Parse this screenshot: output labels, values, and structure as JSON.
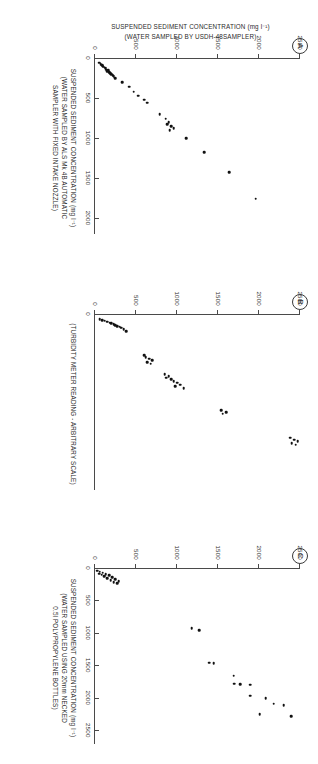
{
  "figure": {
    "orientation": "rotated-90-clockwise",
    "shared_y_axis": {
      "title_line1": "SUSPENDED SEDIMENT CONCENTRATION (mg l⁻¹)",
      "title_line2": "(WATER SAMPLED BY USDH-48SAMPLER)",
      "ticks": [
        0,
        500,
        1000,
        1500,
        2000,
        2500
      ],
      "tick_labels": [
        "0",
        "500",
        "1000",
        "1500",
        "2000",
        "2500"
      ],
      "min": 0,
      "max": 2500
    },
    "panels": [
      {
        "letter": "A",
        "x_title_lines": [
          "SUSPENDED SEDIMENT CONCENTRATION (mg l⁻¹)",
          "(WATER SAMPLED BY ALS Mk 4B AUTOMATIC",
          "SAMPLER WITH FIXED INTAKE NOZZLE)"
        ],
        "x_ticks": [
          0,
          500,
          1000,
          1500,
          2000
        ],
        "x_tick_labels": [
          "0",
          "500",
          "1000",
          "1500",
          "2000"
        ],
        "x_min": 0,
        "x_max": 2150
      },
      {
        "letter": "B",
        "x_title_lines": [
          "(TURBIDITY METER READING - ARBITRARY SCALE)"
        ],
        "x_ticks": [
          0
        ],
        "x_tick_labels": [
          "0"
        ],
        "x_min": 0,
        "x_max": 100
      },
      {
        "letter": "C",
        "x_title_lines": [
          "SUSPENDED SEDIMENT CONCENTRATION (mg l⁻¹)",
          "(WATER SAMPLED USING 20mm NECKED",
          "0.5l POLYPROPYLENE BOTTLES)"
        ],
        "x_ticks": [
          0,
          500,
          1000,
          1500,
          2000,
          2500
        ],
        "x_tick_labels": [
          "0",
          "500",
          "1000",
          "1500",
          "2000",
          "2500"
        ],
        "x_min": 0,
        "x_max": 2650
      }
    ]
  },
  "chart_data": [
    {
      "type": "scatter",
      "title": "A",
      "xlabel": "SUSPENDED SEDIMENT CONCENTRATION (mg l-1) (WATER SAMPLED BY ALS Mk 4B AUTOMATIC SAMPLER WITH FIXED INTAKE NOZZLE)",
      "ylabel": "SUSPENDED SEDIMENT CONCENTRATION (mg l-1) (WATER SAMPLED BY USDH-48SAMPLER)",
      "xlim": [
        0,
        2150
      ],
      "ylim": [
        0,
        2500
      ],
      "grid": false,
      "legend": null,
      "points": [
        [
          60,
          55
        ],
        [
          75,
          70
        ],
        [
          90,
          85
        ],
        [
          100,
          95
        ],
        [
          110,
          105
        ],
        [
          120,
          120
        ],
        [
          130,
          130
        ],
        [
          145,
          140
        ],
        [
          155,
          160
        ],
        [
          165,
          150
        ],
        [
          175,
          175
        ],
        [
          190,
          185
        ],
        [
          205,
          200
        ],
        [
          215,
          215
        ],
        [
          230,
          230
        ],
        [
          250,
          250
        ],
        [
          300,
          330
        ],
        [
          360,
          420
        ],
        [
          420,
          470
        ],
        [
          470,
          530
        ],
        [
          520,
          600
        ],
        [
          560,
          640
        ],
        [
          700,
          790
        ],
        [
          760,
          860
        ],
        [
          800,
          900
        ],
        [
          830,
          880
        ],
        [
          850,
          930
        ],
        [
          880,
          960
        ],
        [
          900,
          910
        ],
        [
          1000,
          1110
        ],
        [
          1180,
          1330
        ],
        [
          1430,
          1640
        ],
        [
          1760,
          1960
        ]
      ]
    },
    {
      "type": "scatter",
      "title": "B",
      "xlabel": "(TURBIDITY METER READING - ARBITRARY SCALE)",
      "ylabel": "SUSPENDED SEDIMENT CONCENTRATION (mg l-1) (WATER SAMPLED BY USDH-48SAMPLER)",
      "xlim": [
        0,
        100
      ],
      "ylim": [
        0,
        2500
      ],
      "grid": false,
      "legend": null,
      "points": [
        [
          3,
          60
        ],
        [
          3.5,
          90
        ],
        [
          4,
          120
        ],
        [
          4.5,
          150
        ],
        [
          5,
          180
        ],
        [
          5.5,
          200
        ],
        [
          6,
          230
        ],
        [
          6.5,
          250
        ],
        [
          7,
          270
        ],
        [
          7.5,
          300
        ],
        [
          8,
          320
        ],
        [
          9,
          350
        ],
        [
          10,
          380
        ],
        [
          24,
          600
        ],
        [
          25,
          620
        ],
        [
          26,
          660
        ],
        [
          27,
          700
        ],
        [
          28,
          640
        ],
        [
          29,
          680
        ],
        [
          35,
          850
        ],
        [
          36,
          900
        ],
        [
          37,
          870
        ],
        [
          38,
          930
        ],
        [
          39,
          960
        ],
        [
          40,
          1000
        ],
        [
          41,
          1040
        ],
        [
          42,
          980
        ],
        [
          43,
          1080
        ],
        [
          56,
          1540
        ],
        [
          57,
          1600
        ],
        [
          58,
          1560
        ],
        [
          72,
          2380
        ],
        [
          73,
          2430
        ],
        [
          74,
          2470
        ],
        [
          75,
          2400
        ],
        [
          76,
          2450
        ]
      ]
    },
    {
      "type": "scatter",
      "title": "C",
      "xlabel": "SUSPENDED SEDIMENT CONCENTRATION (mg l-1) (WATER SAMPLED USING 20mm NECKED 0.5l POLYPROPYLENE BOTTLES)",
      "ylabel": "SUSPENDED SEDIMENT CONCENTRATION (mg l-1) (WATER SAMPLED BY USDH-48SAMPLER)",
      "xlim": [
        0,
        2650
      ],
      "ylim": [
        0,
        2500
      ],
      "grid": false,
      "legend": null,
      "points": [
        [
          40,
          30
        ],
        [
          55,
          60
        ],
        [
          70,
          95
        ],
        [
          85,
          50
        ],
        [
          95,
          130
        ],
        [
          105,
          80
        ],
        [
          115,
          170
        ],
        [
          130,
          110
        ],
        [
          140,
          210
        ],
        [
          155,
          150
        ],
        [
          170,
          250
        ],
        [
          185,
          190
        ],
        [
          200,
          290
        ],
        [
          215,
          230
        ],
        [
          235,
          270
        ],
        [
          930,
          1180
        ],
        [
          960,
          1270
        ],
        [
          1460,
          1390
        ],
        [
          1470,
          1450
        ],
        [
          1660,
          1690
        ],
        [
          1780,
          1700
        ],
        [
          1790,
          1770
        ],
        [
          1800,
          1890
        ],
        [
          1970,
          1890
        ],
        [
          2010,
          2080
        ],
        [
          2090,
          2180
        ],
        [
          2110,
          2300
        ],
        [
          2250,
          2010
        ],
        [
          2280,
          2390
        ]
      ]
    }
  ]
}
